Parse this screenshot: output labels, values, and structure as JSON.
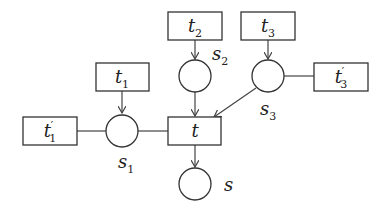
{
  "diagram": {
    "type": "petri-net",
    "transitions": [
      {
        "id": "t1p",
        "name": "t",
        "sub": "1",
        "prime": "′"
      },
      {
        "id": "t1",
        "name": "t",
        "sub": "1"
      },
      {
        "id": "t",
        "name": "t"
      },
      {
        "id": "t2",
        "name": "t",
        "sub": "2"
      },
      {
        "id": "t3",
        "name": "t",
        "sub": "3"
      },
      {
        "id": "t3p",
        "name": "t",
        "sub": "3",
        "prime": "′"
      }
    ],
    "places": [
      {
        "id": "s1",
        "name": "s",
        "sub": "1"
      },
      {
        "id": "s2",
        "name": "s",
        "sub": "2"
      },
      {
        "id": "s3",
        "name": "s",
        "sub": "3"
      },
      {
        "id": "s",
        "name": "s"
      }
    ],
    "edges": [
      {
        "from": "t1",
        "to": "s1",
        "arrow": true
      },
      {
        "from": "t1p",
        "to": "s1",
        "arrow": false
      },
      {
        "from": "s1",
        "to": "t",
        "arrow": false
      },
      {
        "from": "t2",
        "to": "s2",
        "arrow": true
      },
      {
        "from": "s2",
        "to": "t",
        "arrow": true
      },
      {
        "from": "t3",
        "to": "s3",
        "arrow": true
      },
      {
        "from": "s3",
        "to": "t",
        "arrow": true
      },
      {
        "from": "t3p",
        "to": "s3",
        "arrow": false
      },
      {
        "from": "t",
        "to": "s",
        "arrow": true
      }
    ]
  }
}
